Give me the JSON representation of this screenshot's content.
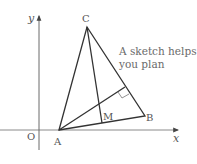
{
  "diagram": {
    "type": "geometry-sketch",
    "axes": {
      "x_label": "x",
      "y_label": "y",
      "origin_label": "O"
    },
    "points": {
      "A": {
        "label": "A"
      },
      "B": {
        "label": "B"
      },
      "C": {
        "label": "C"
      },
      "M": {
        "label": "M"
      }
    },
    "annotation": {
      "line1": "A sketch helps",
      "line2": "you plan"
    },
    "colors": {
      "line": "#3a3a3a",
      "axis": "#777777",
      "text": "#555555"
    }
  }
}
